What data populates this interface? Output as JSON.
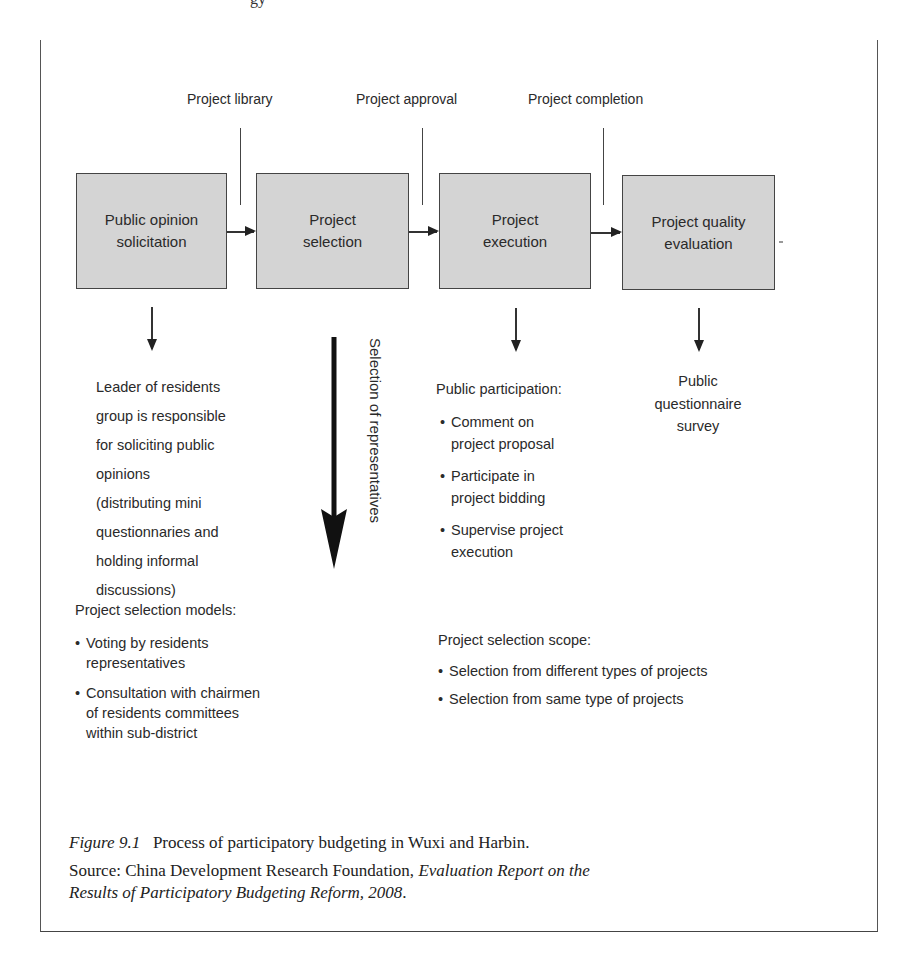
{
  "page_header_fragment": "gy",
  "figure": {
    "milestones": [
      {
        "label": "Project library"
      },
      {
        "label": "Project approval"
      },
      {
        "label": "Project completion"
      }
    ],
    "stages": [
      {
        "label": "Public opinion solicitation",
        "lines": [
          "Public opinion",
          "solicitation"
        ]
      },
      {
        "label": "Project selection",
        "lines": [
          "Project",
          "selection"
        ]
      },
      {
        "label": "Project execution",
        "lines": [
          "Project",
          "execution"
        ]
      },
      {
        "label": "Project quality evaluation",
        "lines": [
          "Project quality",
          "evaluation"
        ]
      }
    ],
    "vertical_arrow_label": "Selection of representatives",
    "solicitation_note": {
      "lines": [
        "Leader of residents",
        "group is responsible",
        "for soliciting public",
        "opinions",
        "(distributing mini",
        "questionnaries and",
        "holding informal",
        "discussions)"
      ]
    },
    "public_participation": {
      "title": "Public participation:",
      "items": [
        {
          "lines": [
            "Comment on",
            "project proposal"
          ]
        },
        {
          "lines": [
            "Participate in",
            "project bidding"
          ]
        },
        {
          "lines": [
            "Supervise project",
            "execution"
          ]
        }
      ]
    },
    "evaluation_note": {
      "lines": [
        "Public",
        "questionnaire",
        "survey"
      ]
    },
    "selection_models": {
      "title": "Project selection models:",
      "items": [
        {
          "lines": [
            "Voting by residents",
            "representatives"
          ]
        },
        {
          "lines": [
            "Consultation with chairmen",
            "of residents committees",
            "within sub-district"
          ]
        }
      ]
    },
    "selection_scope": {
      "title": "Project selection scope:",
      "items": [
        {
          "lines": [
            "Selection from different types of projects"
          ]
        },
        {
          "lines": [
            "Selection from same type of projects"
          ]
        }
      ]
    }
  },
  "caption": {
    "figure_number": "Figure 9.1",
    "title": "Process of participatory budgeting in Wuxi and Harbin.",
    "source_prefix": "Source: China Development Research Foundation, ",
    "source_title_line1": "Evaluation Report on the",
    "source_title_line2": "Results of Participatory Budgeting Reform, 2008",
    "source_suffix": "."
  },
  "colors": {
    "box_fill": "#d4d4d4",
    "line": "#333333",
    "text": "#2a2a2a"
  }
}
